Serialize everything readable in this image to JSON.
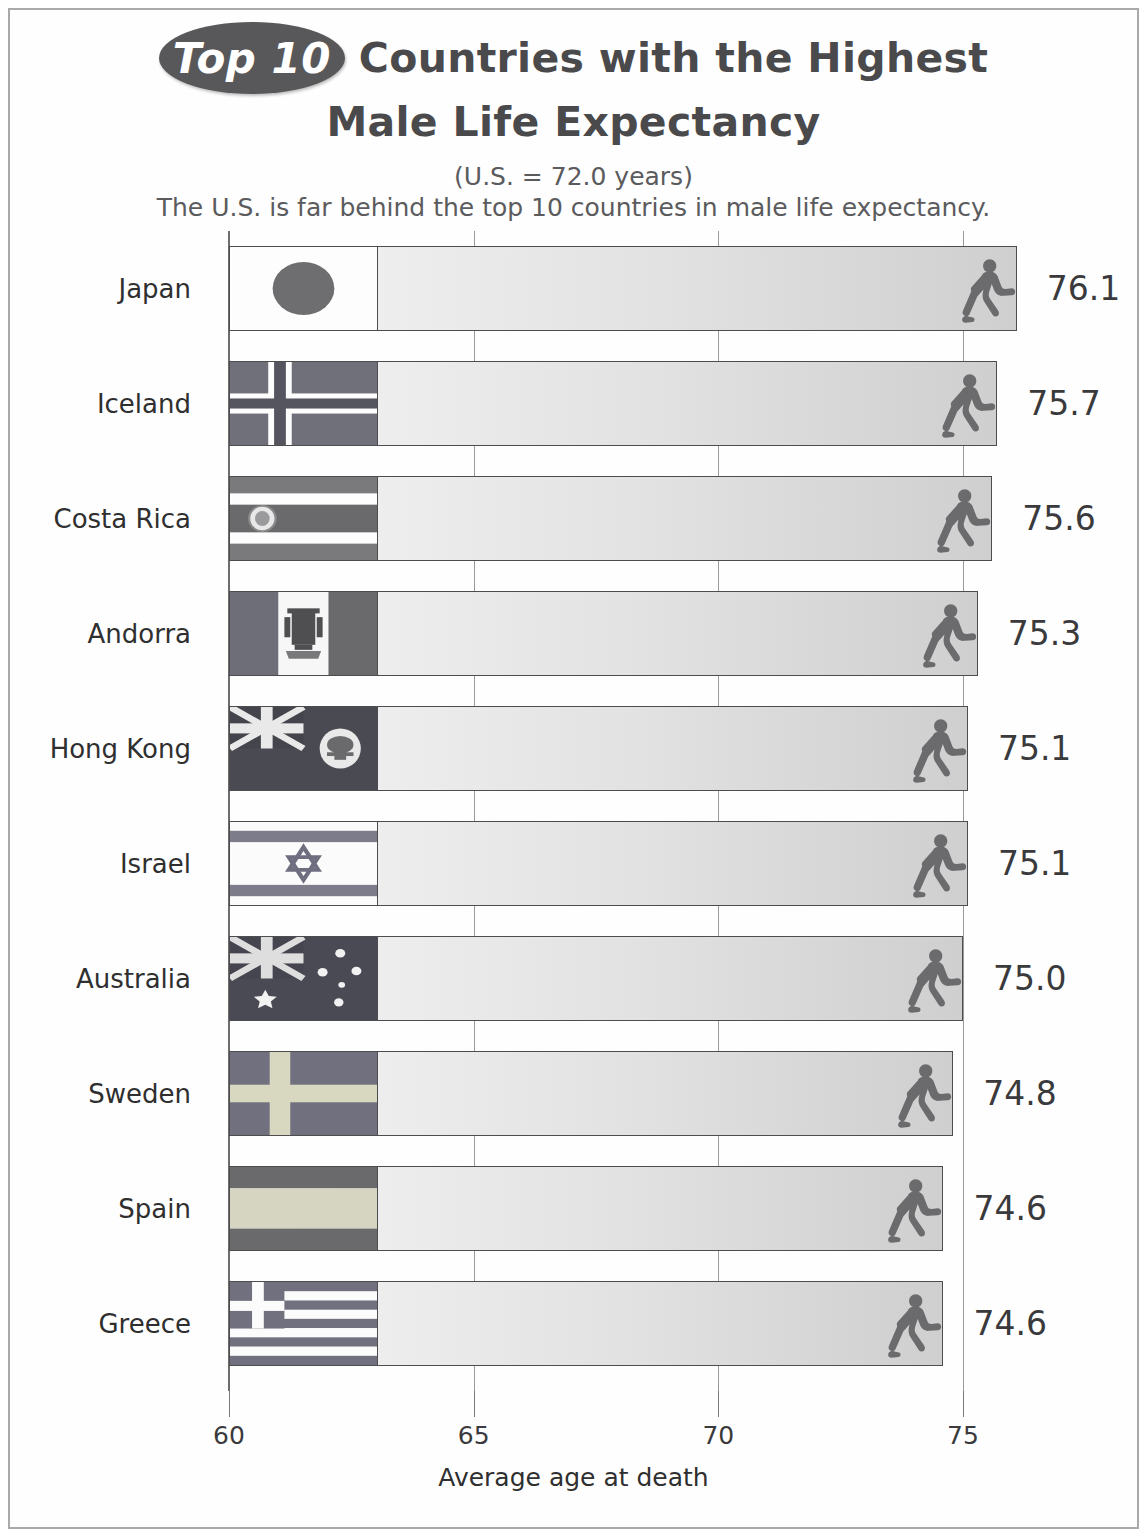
{
  "title": {
    "badge": "Top 10",
    "line1": "Countries with the Highest",
    "line2": "Male Life Expectancy",
    "sub1": "(U.S. = 72.0 years)",
    "sub2": "The U.S. is far behind the top 10 countries in male life expectancy."
  },
  "colors": {
    "badge_bg": "#58585a",
    "title_text": "#4a4a4c",
    "bar_outline": "#4d4d4f",
    "runner": "#6b6b6d",
    "frame": "#a9a9a9"
  },
  "icons": {
    "runner": "running-man-icon"
  },
  "chart_data": {
    "type": "bar",
    "orientation": "horizontal",
    "title": "Top 10 Countries with the Highest Male Life Expectancy",
    "subtitle": "(U.S. = 72.0 years)",
    "annotation": "The U.S. is far behind the top 10 countries in male life expectancy.",
    "xlabel": "Average age at death",
    "ylabel": "",
    "xlim": [
      60,
      76.5
    ],
    "xticks": [
      60,
      65,
      70,
      75
    ],
    "xticklabels": [
      "60",
      "65",
      "70",
      "75"
    ],
    "grid": true,
    "legend": null,
    "reference_value": 72.0,
    "reference_label": "U.S.",
    "categories": [
      "Japan",
      "Iceland",
      "Costa Rica",
      "Andorra",
      "Hong Kong",
      "Israel",
      "Australia",
      "Sweden",
      "Spain",
      "Greece"
    ],
    "values": [
      76.1,
      75.7,
      75.6,
      75.3,
      75.1,
      75.1,
      75.0,
      74.8,
      74.6,
      74.6
    ],
    "value_labels": [
      "76.1",
      "75.7",
      "75.6",
      "75.3",
      "75.1",
      "75.1",
      "75.0",
      "74.8",
      "74.6",
      "74.6"
    ],
    "flags": [
      "japan-flag",
      "iceland-flag",
      "costa-rica-flag",
      "andorra-flag",
      "hong-kong-flag",
      "israel-flag",
      "australia-flag",
      "sweden-flag",
      "spain-flag",
      "greece-flag"
    ]
  }
}
